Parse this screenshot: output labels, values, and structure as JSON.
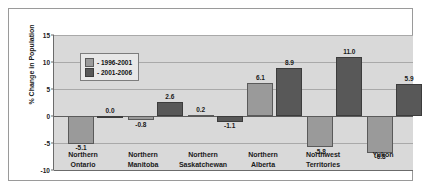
{
  "chart_data": {
    "type": "bar",
    "title": "",
    "xlabel": "",
    "ylabel": "% Change in Population",
    "ylim": [
      -10,
      15
    ],
    "yticks": [
      15,
      10,
      5,
      0,
      -5,
      -10
    ],
    "ytick_labels": [
      "15",
      "10",
      "5",
      "0",
      "-5",
      "-10"
    ],
    "grid": true,
    "legend_position": "upper-left-inside",
    "categories": [
      "Northern Ontario",
      "Northern Manitoba",
      "Northern Saskatchewan",
      "Northern Alberta",
      "Northwest Territories",
      "Yukon"
    ],
    "category_lines": [
      [
        "Northern",
        "Ontario"
      ],
      [
        "Northern",
        "Manitoba"
      ],
      [
        "Northern",
        "Saskatchewan"
      ],
      [
        "Northern",
        "Alberta"
      ],
      [
        "Northwest",
        "Territories"
      ],
      [
        "Yukon",
        ""
      ]
    ],
    "series": [
      {
        "name": "- 1996-2001",
        "color": "#9a9a9a",
        "values": [
          -5.1,
          -0.8,
          0.2,
          6.1,
          -5.8,
          -6.8
        ],
        "labels": [
          "-5.1",
          "-0.8",
          "0.2",
          "6.1",
          "-5.8",
          "-6.8"
        ]
      },
      {
        "name": "- 2001-2006",
        "color": "#585858",
        "values": [
          0.0,
          2.6,
          -1.1,
          8.9,
          11.0,
          5.9
        ],
        "labels": [
          "0.0",
          "2.6",
          "-1.1",
          "8.9",
          "11.0",
          "5.9"
        ]
      }
    ]
  },
  "colors": {
    "series1": "#9a9a9a",
    "series2": "#585858",
    "plot_background": "#d9d9d9",
    "gridline": "#a9a9a9",
    "axis": "#6b6b6b",
    "text": "#1a1a1a",
    "legend_background": "#e8e8e8"
  }
}
